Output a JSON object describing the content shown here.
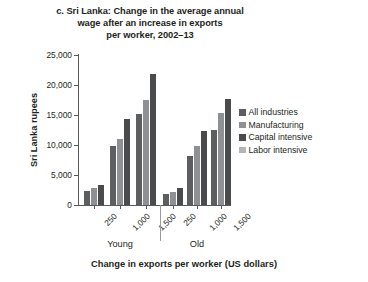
{
  "chart_data": {
    "type": "bar",
    "title": "c. Sri Lanka: Change in the average annual wage after an increase in exports per worker, 2002–13",
    "title_lines": [
      "c. Sri Lanka: Change in the average annual",
      "wage after an increase in exports",
      "per worker, 2002–13"
    ],
    "xlabel": "Change in exports per worker (US dollars)",
    "ylabel": "Sri Lanka rupees",
    "ylim": [
      0,
      25000
    ],
    "ytick_labels": [
      "25,000",
      "20,000",
      "15,000",
      "10,000",
      "5,000",
      "0"
    ],
    "ytick_values": [
      25000,
      20000,
      15000,
      10000,
      5000,
      0
    ],
    "grid": false,
    "legend_position": "right",
    "groups": [
      "Young",
      "Old"
    ],
    "categories": [
      "250",
      "1,000",
      "1,500",
      "250",
      "1,000",
      "1,500"
    ],
    "series": [
      {
        "name": "All industries",
        "color": "#5d5e60",
        "values": [
          2400,
          9800,
          15200,
          1900,
          8200,
          12500
        ]
      },
      {
        "name": "Manufacturing",
        "color": "#8f9093",
        "values": [
          2800,
          11000,
          17500,
          2200,
          9800,
          15400
        ]
      },
      {
        "name": "Capital intensive",
        "color": "#4a4b4d",
        "values": [
          3400,
          14400,
          21800,
          2800,
          12400,
          17600
        ]
      },
      {
        "name": "Labor intensive",
        "color": "#b4b5b7",
        "values": [
          3400,
          14400,
          21800,
          2800,
          12400,
          17600
        ]
      }
    ],
    "rendered_series_order": [
      "All industries",
      "Manufacturing",
      "Capital intensive"
    ],
    "legend": [
      {
        "label": "All industries",
        "color": "#5d5e60"
      },
      {
        "label": "Manufacturing",
        "color": "#8f9093"
      },
      {
        "label": "Capital intensive",
        "color": "#4a4b4d"
      },
      {
        "label": "Labor intensive",
        "color": "#b4b5b7"
      }
    ]
  }
}
